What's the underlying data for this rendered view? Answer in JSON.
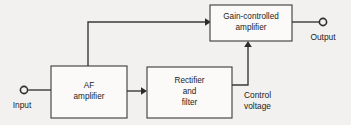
{
  "diagram": {
    "background_color": "#f3f1ef",
    "line_color": "#3a3a3a",
    "block_fill_color": "#fbfaf9",
    "blocks": [
      {
        "id": "gain-controlled-amplifier",
        "line1": "Gain-controlled",
        "line2": "amplifier",
        "line3": ""
      },
      {
        "id": "af-amplifier",
        "line1": "AF",
        "line2": "amplifier",
        "line3": ""
      },
      {
        "id": "rectifier-and-filter",
        "line1": "Rectifier",
        "line2": "and",
        "line3": "filter"
      }
    ],
    "terminals": [
      {
        "id": "input-terminal",
        "label": "Input"
      },
      {
        "id": "output-terminal",
        "label": "Output"
      }
    ],
    "signal_labels": [
      {
        "id": "control-voltage",
        "line1": "Control",
        "line2": "voltage"
      }
    ]
  }
}
